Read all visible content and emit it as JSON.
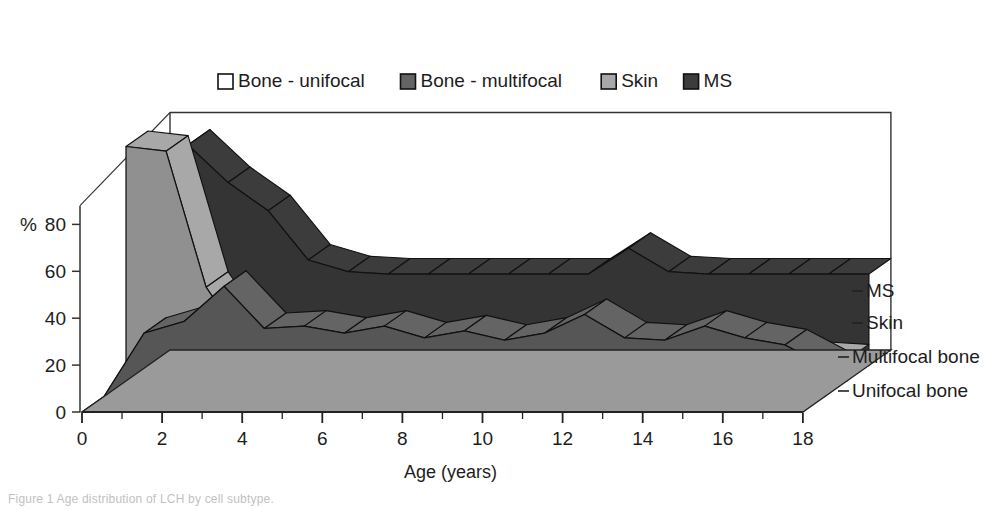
{
  "figure": {
    "caption": "Figure 1 Age distribution of LCH by cell subtype.",
    "background": "#ffffff"
  },
  "legend": {
    "position": "top-center-inside",
    "items": [
      {
        "label": "Bone - unifocal",
        "swatch": "#ffffff",
        "icon": "legend-swatch"
      },
      {
        "label": "Bone - multifocal",
        "swatch": "#646464",
        "icon": "legend-swatch"
      },
      {
        "label": "Skin",
        "swatch": "#a8a8a8",
        "icon": "legend-swatch"
      },
      {
        "label": "MS",
        "swatch": "#3c3c3c",
        "icon": "legend-swatch"
      }
    ]
  },
  "series_labels": {
    "ms": "MS",
    "skin": "Skin",
    "multifocal": "Multifocal bone",
    "unifocal": "Unifocal bone"
  },
  "axes": {
    "y": {
      "unit_label": "%",
      "ticks": [
        "0",
        "20",
        "40",
        "60",
        "80"
      ],
      "min": 0,
      "max": 100
    },
    "x": {
      "title": "Age (years)",
      "ticks": [
        "0",
        "2",
        "4",
        "6",
        "8",
        "10",
        "12",
        "14",
        "16",
        "18"
      ],
      "min": 0,
      "max": 18
    }
  },
  "chart_data": {
    "type": "area",
    "title": "",
    "subtitle": "",
    "xlabel": "Age (years)",
    "ylabel": "%",
    "xlim": [
      0,
      18
    ],
    "ylim": [
      0,
      100
    ],
    "grid": false,
    "legend_position": "top-center",
    "projection": "3d-ribbon",
    "x": [
      0,
      1,
      2,
      3,
      4,
      5,
      6,
      7,
      8,
      9,
      10,
      11,
      12,
      13,
      14,
      15,
      16,
      17,
      18
    ],
    "categories": [
      "0",
      "1",
      "2",
      "3",
      "4",
      "5",
      "6",
      "7",
      "8",
      "9",
      "10",
      "11",
      "12",
      "13",
      "14",
      "15",
      "16",
      "17",
      "18"
    ],
    "series": [
      {
        "name": "Unifocal bone",
        "legend_name": "Bone - unifocal",
        "color": "#ffffff",
        "depth_index": 0,
        "values": [
          0,
          6,
          10,
          11,
          12,
          9,
          12,
          9,
          12,
          11,
          10,
          9,
          14,
          11,
          10,
          15,
          12,
          10,
          3
        ]
      },
      {
        "name": "Multifocal bone",
        "legend_name": "Bone - multifocal",
        "color": "#646464",
        "depth_index": 1,
        "values": [
          0,
          27,
          32,
          47,
          29,
          30,
          27,
          30,
          25,
          28,
          24,
          27,
          35,
          25,
          24,
          30,
          25,
          22,
          13
        ]
      },
      {
        "name": "Skin",
        "legend_name": "Skin",
        "color": "#a8a8a8",
        "depth_index": 2,
        "values": [
          100,
          98,
          40,
          15,
          13,
          11,
          10,
          10,
          10,
          10,
          10,
          11,
          18,
          11,
          10,
          10,
          10,
          10,
          9
        ]
      },
      {
        "name": "MS",
        "legend_name": "MS",
        "color": "#3c3c3c",
        "depth_index": 3,
        "values": [
          0,
          94,
          78,
          66,
          45,
          40,
          39,
          39,
          39,
          39,
          39,
          39,
          50,
          40,
          39,
          39,
          39,
          39,
          39
        ]
      }
    ]
  }
}
